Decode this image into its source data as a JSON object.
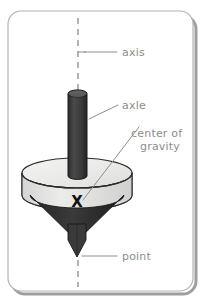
{
  "figure": {
    "background_color": "#ffffff",
    "card": {
      "fill": "#ffffff",
      "border_color": "#b0b0b0",
      "shadow_color": "#9a9a9a",
      "corner_radius": 13
    },
    "axis_line": {
      "name": "vertical rotation axis",
      "style": "dashed",
      "color": "#8a8a8a",
      "x": 78,
      "y_top": 18,
      "y_bottom": 287
    },
    "labels": [
      {
        "id": "axis",
        "text": "axis",
        "x": 122,
        "y": 56,
        "leader": {
          "type": "straight",
          "x1": 84,
          "y1": 52,
          "x2": 117,
          "y2": 52
        },
        "color": "#8d8d8d"
      },
      {
        "id": "axle",
        "text": "axle",
        "x": 122,
        "y": 110,
        "leader": {
          "type": "straight",
          "x1": 90,
          "y1": 118,
          "x2": 118,
          "y2": 105
        },
        "color": "#8d8d8d"
      },
      {
        "id": "center-of-gravity-line-1",
        "text": "center of",
        "x": 132,
        "y": 137,
        "leader": {
          "type": "straight",
          "x1": 84,
          "y1": 200,
          "x2": 139,
          "y2": 128
        },
        "color": "#8d8d8d"
      },
      {
        "id": "center-of-gravity-line-2",
        "text": "gravity",
        "x": 140,
        "y": 150,
        "leader": null,
        "color": "#8d8d8d"
      },
      {
        "id": "point",
        "text": "point",
        "x": 122,
        "y": 260,
        "leader": {
          "type": "straight",
          "x1": 82,
          "y1": 256,
          "x2": 117,
          "y2": 256
        },
        "color": "#8d8d8d"
      }
    ],
    "parts": {
      "axle": {
        "name": "axle",
        "shape": "cylinder",
        "fill": "#3c3c3c",
        "top_ellipse_fill": "#585858",
        "stroke": "#1a1a1a",
        "left": 68,
        "right": 87,
        "top": 90,
        "bottom": 178
      },
      "disk": {
        "name": "disk",
        "shape": "cylinder",
        "top_fill": "#eaeae8",
        "side_fill": "#dcdcda",
        "stroke": "#2a2a2a",
        "cx": 77,
        "cy_top": 173,
        "rx": 55,
        "ry": 15,
        "height": 22
      },
      "cone": {
        "name": "cone-body",
        "shape": "cone",
        "fill": "#2e2e2e",
        "stroke": "#1a1a1a",
        "cx": 77,
        "cy_top": 195,
        "rx": 47,
        "ry": 13,
        "apex_y": 240
      },
      "tip": {
        "name": "point-tip",
        "shape": "spike",
        "fill": "#3a3a3a",
        "stroke": "#1a1a1a",
        "cx": 77,
        "top_y": 222,
        "apex_y": 257,
        "half_width": 9
      },
      "center_of_gravity_marker": {
        "name": "center-of-gravity-x",
        "glyph": "X",
        "x": 77,
        "y": 206,
        "color": "#111111"
      }
    }
  }
}
